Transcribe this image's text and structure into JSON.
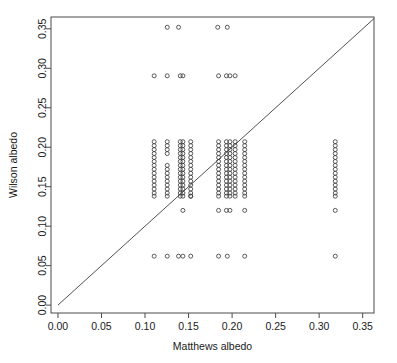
{
  "chart_data": {
    "type": "scatter",
    "title": "",
    "xlabel": "Matthews albedo",
    "ylabel": "Wilson albedo",
    "xlim": [
      -0.008,
      0.363
    ],
    "ylim": [
      -0.01,
      0.365
    ],
    "xticks": [
      0.0,
      0.05,
      0.1,
      0.15,
      0.2,
      0.25,
      0.3,
      0.35
    ],
    "xticklabels": [
      "0.00",
      "0.05",
      "0.10",
      "0.15",
      "0.20",
      "0.25",
      "0.30",
      "0.35"
    ],
    "yticks": [
      0.0,
      0.05,
      0.1,
      0.15,
      0.2,
      0.25,
      0.3,
      0.35
    ],
    "yticklabels": [
      "0.00",
      "0.05",
      "0.10",
      "0.15",
      "0.20",
      "0.25",
      "0.30",
      "0.35"
    ],
    "grid": false,
    "legend": null,
    "marker": "open-circle",
    "marker_size": 4,
    "marker_color": "#3d3d3d",
    "reference_line": {
      "type": "identity",
      "label": "y = x",
      "from": [
        0.0,
        0.0
      ],
      "to": [
        0.363,
        0.363
      ],
      "color": "#3d3d3d"
    },
    "points": [
      [
        0.1255,
        0.352
      ],
      [
        0.1385,
        0.352
      ],
      [
        0.1835,
        0.352
      ],
      [
        0.1945,
        0.352
      ],
      [
        0.1105,
        0.2905
      ],
      [
        0.1255,
        0.2905
      ],
      [
        0.1405,
        0.2905
      ],
      [
        0.1435,
        0.2905
      ],
      [
        0.1845,
        0.2905
      ],
      [
        0.1935,
        0.2905
      ],
      [
        0.1975,
        0.2905
      ],
      [
        0.2035,
        0.2905
      ],
      [
        0.1105,
        0.207
      ],
      [
        0.1105,
        0.202
      ],
      [
        0.1105,
        0.197
      ],
      [
        0.1105,
        0.192
      ],
      [
        0.1105,
        0.187
      ],
      [
        0.1105,
        0.182
      ],
      [
        0.1105,
        0.177
      ],
      [
        0.1105,
        0.172
      ],
      [
        0.1105,
        0.167
      ],
      [
        0.1105,
        0.162
      ],
      [
        0.1105,
        0.157
      ],
      [
        0.1105,
        0.152
      ],
      [
        0.1105,
        0.147
      ],
      [
        0.1105,
        0.142
      ],
      [
        0.1105,
        0.138
      ],
      [
        0.1255,
        0.207
      ],
      [
        0.1255,
        0.202
      ],
      [
        0.1255,
        0.197
      ],
      [
        0.1255,
        0.192
      ],
      [
        0.1255,
        0.177
      ],
      [
        0.1255,
        0.172
      ],
      [
        0.1255,
        0.167
      ],
      [
        0.1255,
        0.162
      ],
      [
        0.1255,
        0.157
      ],
      [
        0.1255,
        0.152
      ],
      [
        0.1255,
        0.147
      ],
      [
        0.1255,
        0.142
      ],
      [
        0.1255,
        0.138
      ],
      [
        0.1405,
        0.207
      ],
      [
        0.1405,
        0.202
      ],
      [
        0.1405,
        0.197
      ],
      [
        0.1405,
        0.192
      ],
      [
        0.1405,
        0.187
      ],
      [
        0.1405,
        0.182
      ],
      [
        0.1405,
        0.177
      ],
      [
        0.1405,
        0.172
      ],
      [
        0.1405,
        0.167
      ],
      [
        0.1405,
        0.162
      ],
      [
        0.1405,
        0.157
      ],
      [
        0.1405,
        0.152
      ],
      [
        0.1405,
        0.147
      ],
      [
        0.1405,
        0.142
      ],
      [
        0.1405,
        0.138
      ],
      [
        0.1435,
        0.207
      ],
      [
        0.1435,
        0.202
      ],
      [
        0.1435,
        0.197
      ],
      [
        0.1435,
        0.192
      ],
      [
        0.1435,
        0.187
      ],
      [
        0.1435,
        0.182
      ],
      [
        0.1435,
        0.177
      ],
      [
        0.1435,
        0.172
      ],
      [
        0.1435,
        0.167
      ],
      [
        0.1435,
        0.162
      ],
      [
        0.1435,
        0.157
      ],
      [
        0.1435,
        0.152
      ],
      [
        0.1435,
        0.147
      ],
      [
        0.1435,
        0.142
      ],
      [
        0.1435,
        0.138
      ],
      [
        0.1525,
        0.207
      ],
      [
        0.1525,
        0.202
      ],
      [
        0.1525,
        0.197
      ],
      [
        0.1525,
        0.192
      ],
      [
        0.1525,
        0.187
      ],
      [
        0.1525,
        0.182
      ],
      [
        0.1525,
        0.177
      ],
      [
        0.1525,
        0.172
      ],
      [
        0.1525,
        0.167
      ],
      [
        0.1525,
        0.162
      ],
      [
        0.1525,
        0.157
      ],
      [
        0.1525,
        0.152
      ],
      [
        0.1525,
        0.147
      ],
      [
        0.1525,
        0.142
      ],
      [
        0.1525,
        0.138
      ],
      [
        0.1435,
        0.12
      ],
      [
        0.1525,
        0.138
      ],
      [
        0.1845,
        0.207
      ],
      [
        0.1845,
        0.202
      ],
      [
        0.1845,
        0.197
      ],
      [
        0.1845,
        0.192
      ],
      [
        0.1845,
        0.187
      ],
      [
        0.1845,
        0.182
      ],
      [
        0.1845,
        0.177
      ],
      [
        0.1845,
        0.172
      ],
      [
        0.1845,
        0.167
      ],
      [
        0.1845,
        0.162
      ],
      [
        0.1845,
        0.157
      ],
      [
        0.1845,
        0.152
      ],
      [
        0.1845,
        0.147
      ],
      [
        0.1845,
        0.142
      ],
      [
        0.1845,
        0.138
      ],
      [
        0.1845,
        0.12
      ],
      [
        0.1935,
        0.207
      ],
      [
        0.1935,
        0.202
      ],
      [
        0.1935,
        0.197
      ],
      [
        0.1935,
        0.192
      ],
      [
        0.1935,
        0.187
      ],
      [
        0.1935,
        0.182
      ],
      [
        0.1935,
        0.177
      ],
      [
        0.1935,
        0.172
      ],
      [
        0.1935,
        0.167
      ],
      [
        0.1935,
        0.162
      ],
      [
        0.1935,
        0.157
      ],
      [
        0.1935,
        0.152
      ],
      [
        0.1935,
        0.147
      ],
      [
        0.1935,
        0.142
      ],
      [
        0.1935,
        0.138
      ],
      [
        0.1935,
        0.12
      ],
      [
        0.1975,
        0.207
      ],
      [
        0.1975,
        0.202
      ],
      [
        0.1975,
        0.197
      ],
      [
        0.1975,
        0.192
      ],
      [
        0.1975,
        0.187
      ],
      [
        0.1975,
        0.182
      ],
      [
        0.1975,
        0.177
      ],
      [
        0.1975,
        0.172
      ],
      [
        0.1975,
        0.167
      ],
      [
        0.1975,
        0.162
      ],
      [
        0.1975,
        0.157
      ],
      [
        0.1975,
        0.152
      ],
      [
        0.1975,
        0.147
      ],
      [
        0.1975,
        0.142
      ],
      [
        0.1975,
        0.138
      ],
      [
        0.1975,
        0.12
      ],
      [
        0.2035,
        0.207
      ],
      [
        0.2035,
        0.202
      ],
      [
        0.2035,
        0.197
      ],
      [
        0.2035,
        0.192
      ],
      [
        0.2035,
        0.187
      ],
      [
        0.2035,
        0.182
      ],
      [
        0.2035,
        0.177
      ],
      [
        0.2035,
        0.172
      ],
      [
        0.2035,
        0.167
      ],
      [
        0.2035,
        0.162
      ],
      [
        0.2035,
        0.157
      ],
      [
        0.2035,
        0.152
      ],
      [
        0.2035,
        0.147
      ],
      [
        0.2035,
        0.142
      ],
      [
        0.2035,
        0.138
      ],
      [
        0.2145,
        0.207
      ],
      [
        0.2145,
        0.202
      ],
      [
        0.2145,
        0.197
      ],
      [
        0.2145,
        0.192
      ],
      [
        0.2145,
        0.187
      ],
      [
        0.2145,
        0.182
      ],
      [
        0.2145,
        0.177
      ],
      [
        0.2145,
        0.172
      ],
      [
        0.2145,
        0.167
      ],
      [
        0.2145,
        0.162
      ],
      [
        0.2145,
        0.157
      ],
      [
        0.2145,
        0.152
      ],
      [
        0.2145,
        0.147
      ],
      [
        0.2145,
        0.142
      ],
      [
        0.2145,
        0.138
      ],
      [
        0.2145,
        0.12
      ],
      [
        0.3185,
        0.207
      ],
      [
        0.3185,
        0.202
      ],
      [
        0.3185,
        0.197
      ],
      [
        0.3185,
        0.192
      ],
      [
        0.3185,
        0.187
      ],
      [
        0.3185,
        0.182
      ],
      [
        0.3185,
        0.177
      ],
      [
        0.3185,
        0.172
      ],
      [
        0.3185,
        0.167
      ],
      [
        0.3185,
        0.162
      ],
      [
        0.3185,
        0.157
      ],
      [
        0.3185,
        0.152
      ],
      [
        0.3185,
        0.147
      ],
      [
        0.3185,
        0.142
      ],
      [
        0.3185,
        0.138
      ],
      [
        0.3185,
        0.12
      ],
      [
        0.1105,
        0.062
      ],
      [
        0.1255,
        0.062
      ],
      [
        0.1385,
        0.062
      ],
      [
        0.1435,
        0.062
      ],
      [
        0.1525,
        0.062
      ],
      [
        0.1845,
        0.062
      ],
      [
        0.1945,
        0.062
      ],
      [
        0.2145,
        0.062
      ],
      [
        0.3185,
        0.062
      ]
    ]
  },
  "axes": {
    "x_title": "Matthews albedo",
    "y_title": "Wilson albedo"
  }
}
